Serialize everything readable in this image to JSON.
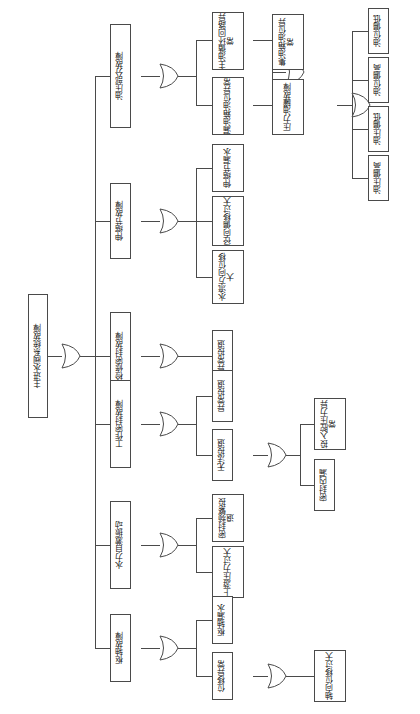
{
  "diagram": {
    "type": "fault-tree",
    "orientation": "rotated-90-ccw",
    "gate_type": "OR"
  },
  "nodes": {
    "root": "主进水阀系统故障",
    "l1_oil": "油压部分故障",
    "l1_expansion": "伸缩节故障",
    "l1_maint_seal": "检修密封故障",
    "l1_work_seal": "工作密封故障",
    "l1_hydraulic_vib": "水力自激振动",
    "l1_pivot": "枢轴故障",
    "l2_main_oil_loop": "主油循环回路异常",
    "l2_leak_oil_level": "漏油箱油位异常",
    "l2_collect_oil_level": "集油箱油位异常",
    "l2_pressure_tank": "压力油罐故障",
    "l2_expansion_leak": "伸缩节漏水",
    "l2_radial_offset": "径向偏移过大",
    "l2_flow_dir_disp": "水流方向位移大",
    "l2_maint_abnormal": "异常投退",
    "l2_work_abnormal": "异常投退",
    "l2_work_cannot": "无法投退",
    "l2_seal_freq": "密封频繁投退",
    "l2_upstream_press": "上游压力过大",
    "l2_pivot_leak": "枢轴漏水",
    "l2_disp_abnormal": "位移异常",
    "l3_oil_level_low": "油位偏低",
    "l3_oil_level_high": "油位偏高",
    "l3_oil_press_low": "油压偏低",
    "l3_oil_press_high": "油压偏高",
    "l3_in_chamber_press": "投入腔压力异常",
    "l3_seal_inner_leak": "密封内漏",
    "l3_axial_disp": "轴向位移过大"
  },
  "colors": {
    "stroke": "#4a4a4a",
    "background": "#ffffff",
    "text": "#111111"
  }
}
